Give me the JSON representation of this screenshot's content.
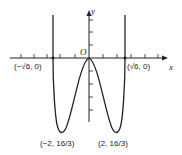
{
  "figure": {
    "type": "function-graph",
    "axes": {
      "x_label": "x",
      "y_label": "y",
      "origin_label": "O"
    },
    "points": {
      "left_root": "(−√6, 0)",
      "right_root": "(√6, 0)",
      "left_min": "(−2, 16/3)",
      "right_min": "(2, 16/3)"
    },
    "colors": {
      "ink": "#222222",
      "background": "#ffffff"
    }
  }
}
